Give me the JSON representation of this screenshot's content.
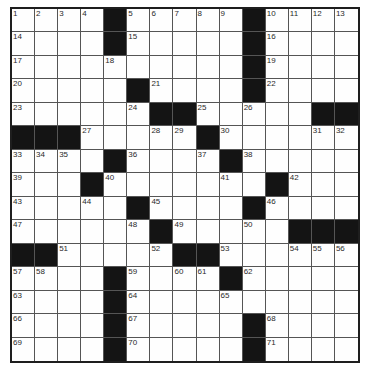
{
  "puzzle": {
    "rows": 15,
    "cols": 15,
    "colors": {
      "block": "#141414",
      "cell": "#fefefe",
      "gridline": "#555555",
      "border": "#1e1e1e",
      "number": "#2a2a2a"
    },
    "grid": [
      [
        "1",
        "2",
        "3",
        "4",
        "#",
        "5",
        "6",
        "7",
        "8",
        "9",
        "#",
        "10",
        "11",
        "12",
        "13"
      ],
      [
        "14",
        "",
        "",
        "",
        "#",
        "15",
        "",
        "",
        "",
        "",
        "#",
        "16",
        "",
        "",
        ""
      ],
      [
        "17",
        "",
        "",
        "",
        "18",
        "",
        "",
        "",
        "",
        "",
        "#",
        "19",
        "",
        "",
        ""
      ],
      [
        "20",
        "",
        "",
        "",
        "",
        "#",
        "21",
        "",
        "",
        "",
        "#",
        "22",
        "",
        "",
        ""
      ],
      [
        "23",
        "",
        "",
        "",
        "",
        "24",
        "#",
        "#",
        "25",
        "",
        "26",
        "",
        "",
        "#",
        "#"
      ],
      [
        "#",
        "#",
        "#",
        "27",
        "",
        "",
        "28",
        "29",
        "#",
        "30",
        "",
        "",
        "",
        "31",
        "32"
      ],
      [
        "33",
        "34",
        "35",
        "",
        "#",
        "36",
        "",
        "",
        "37",
        "#",
        "38",
        "",
        "",
        "",
        ""
      ],
      [
        "39",
        "",
        "",
        "#",
        "40",
        "",
        "",
        "",
        "",
        "41",
        "",
        "#",
        "42",
        "",
        ""
      ],
      [
        "43",
        "",
        "",
        "44",
        "",
        "#",
        "45",
        "",
        "",
        "",
        "#",
        "46",
        "",
        "",
        ""
      ],
      [
        "47",
        "",
        "",
        "",
        "",
        "48",
        "#",
        "49",
        "",
        "",
        "50",
        "",
        "#",
        "#",
        "#"
      ],
      [
        "#",
        "#",
        "51",
        "",
        "",
        "",
        "52",
        "#",
        "#",
        "53",
        "",
        "",
        "54",
        "55",
        "56"
      ],
      [
        "57",
        "58",
        "",
        "",
        "#",
        "59",
        "",
        "60",
        "61",
        "#",
        "62",
        "",
        "",
        "",
        ""
      ],
      [
        "63",
        "",
        "",
        "",
        "#",
        "64",
        "",
        "",
        "",
        "65",
        "",
        "",
        "",
        "",
        ""
      ],
      [
        "66",
        "",
        "",
        "",
        "#",
        "67",
        "",
        "",
        "",
        "",
        "#",
        "68",
        "",
        "",
        ""
      ],
      [
        "69",
        "",
        "",
        "",
        "#",
        "70",
        "",
        "",
        "",
        "",
        "#",
        "71",
        "",
        "",
        ""
      ]
    ]
  }
}
